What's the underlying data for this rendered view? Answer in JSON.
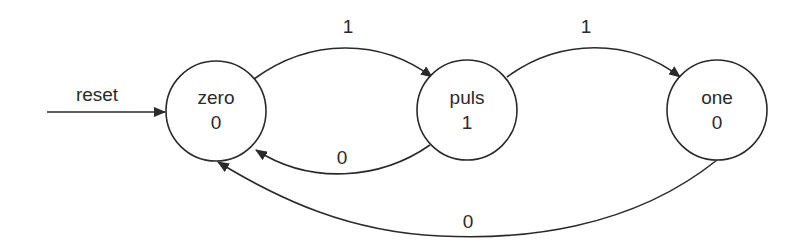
{
  "diagram": {
    "type": "state-machine",
    "colors": {
      "stroke": "#2a2a2a",
      "background": "#ffffff"
    },
    "states": [
      {
        "id": "zero",
        "name": "zero",
        "output": "0",
        "cx": 216,
        "cy": 111,
        "r": 50
      },
      {
        "id": "puls",
        "name": "puls",
        "output": "1",
        "cx": 467,
        "cy": 110,
        "r": 50
      },
      {
        "id": "one",
        "name": "one",
        "output": "0",
        "cx": 717,
        "cy": 110,
        "r": 50
      }
    ],
    "reset": {
      "label": "reset",
      "target": "zero"
    },
    "transitions": [
      {
        "from": "zero",
        "to": "puls",
        "label": "1"
      },
      {
        "from": "puls",
        "to": "one",
        "label": "1"
      },
      {
        "from": "puls",
        "to": "zero",
        "label": "0"
      },
      {
        "from": "one",
        "to": "zero",
        "label": "0"
      }
    ]
  }
}
